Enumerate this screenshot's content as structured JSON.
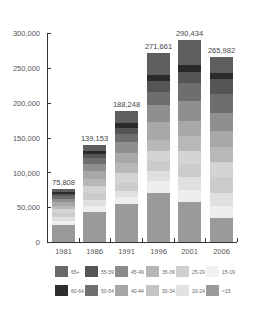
{
  "chart_data": {
    "type": "bar",
    "stacked": true,
    "title": "",
    "xlabel": "",
    "ylabel": "",
    "ylim": [
      0,
      300000
    ],
    "yticks": [
      "0",
      "50,000",
      "100,000",
      "150,000",
      "200,000",
      "250,000",
      "300,000"
    ],
    "grid": false,
    "legend_position": "bottom",
    "categories": [
      "1981",
      "1986",
      "1991",
      "1996",
      "2001",
      "2006"
    ],
    "totals": [
      75808,
      139153,
      188248,
      271661,
      290434,
      265982
    ],
    "total_labels": [
      "75,808",
      "139,153",
      "188,248",
      "271,661",
      "290,434",
      "265,982"
    ],
    "series": [
      {
        "name": "<15",
        "color": "#9a9a9a",
        "values": [
          24000,
          43000,
          55000,
          70000,
          57000,
          35000
        ]
      },
      {
        "name": "15-19",
        "color": "#eeeeee",
        "values": [
          6000,
          8000,
          9000,
          18000,
          17000,
          17000
        ]
      },
      {
        "name": "20-24",
        "color": "#e0e0e0",
        "values": [
          6000,
          9000,
          9000,
          14000,
          19000,
          19000
        ]
      },
      {
        "name": "25-29",
        "color": "#cccccc",
        "values": [
          6000,
          10000,
          12000,
          14000,
          19000,
          22000
        ]
      },
      {
        "name": "30-34",
        "color": "#d4d4d4",
        "values": [
          5000,
          10000,
          14000,
          15000,
          18000,
          22000
        ]
      },
      {
        "name": "35-39",
        "color": "#b8b8b8",
        "values": [
          5000,
          11000,
          14000,
          16000,
          22000,
          22000
        ]
      },
      {
        "name": "40-44",
        "color": "#a8a8a8",
        "values": [
          5000,
          11000,
          15000,
          26000,
          22000,
          22000
        ]
      },
      {
        "name": "45-49",
        "color": "#8f8f8f",
        "values": [
          4500,
          10000,
          15000,
          23000,
          28000,
          27000
        ]
      },
      {
        "name": "50-54",
        "color": "#6e6e6e",
        "values": [
          4000,
          8000,
          12000,
          20000,
          26000,
          26000
        ]
      },
      {
        "name": "55-59",
        "color": "#555555",
        "values": [
          3300,
          6153,
          9248,
          14661,
          16434,
          21982
        ]
      },
      {
        "name": "60-64",
        "color": "#2a2a2a",
        "values": [
          3008,
          5000,
          7000,
          9000,
          10000,
          9000
        ]
      },
      {
        "name": "65+",
        "color": "#5e5e5e",
        "values": [
          4000,
          8000,
          17000,
          32000,
          36000,
          23000
        ]
      }
    ]
  },
  "legend": {
    "items": [
      {
        "label": "65+",
        "color": "#6a6a6a"
      },
      {
        "label": "60-64",
        "color": "#2e2e2e"
      },
      {
        "label": "55-59",
        "color": "#555555"
      },
      {
        "label": "50-54",
        "color": "#707070"
      },
      {
        "label": "45-49",
        "color": "#8c8c8c"
      },
      {
        "label": "40-44",
        "color": "#a6a6a6"
      },
      {
        "label": "35-39",
        "color": "#b6b6b6"
      },
      {
        "label": "30-34",
        "color": "#c4c4c4"
      },
      {
        "label": "25-29",
        "color": "#cfcfcf"
      },
      {
        "label": "20-24",
        "color": "#e2e2e2"
      },
      {
        "label": "15-19",
        "color": "#f0f0f0"
      },
      {
        "label": "<15",
        "color": "#9a9a9a"
      }
    ]
  }
}
